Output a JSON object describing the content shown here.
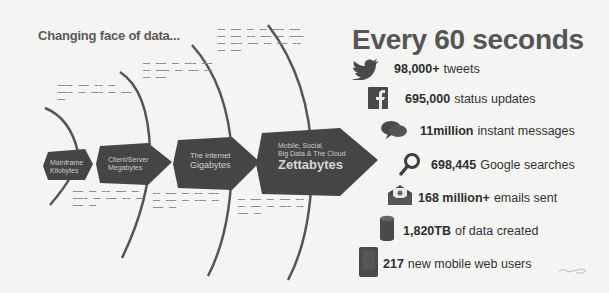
{
  "left_panel": {
    "title": "Changing face of data...",
    "stages": [
      {
        "line1": "Mainframe",
        "line2": "Kilobytes",
        "big": ""
      },
      {
        "line1": "Client/Server",
        "line2": "Megabytes",
        "big": ""
      },
      {
        "line1": "The Internet",
        "line2": "Gigabytes",
        "big": ""
      },
      {
        "line1": "Mobile, Social,",
        "line2": "Big Data & The Cloud",
        "big": "Zettabytes"
      }
    ]
  },
  "right_panel": {
    "title": "Every 60 seconds",
    "stats": [
      {
        "icon": "twitter-bird-icon",
        "value": "98,000+",
        "label": "tweets"
      },
      {
        "icon": "facebook-icon",
        "value": "695,000",
        "label": "status updates"
      },
      {
        "icon": "chat-bubbles-icon",
        "value": "11million",
        "label": "instant messages"
      },
      {
        "icon": "magnifier-icon",
        "value": "698,445",
        "label": "Google searches"
      },
      {
        "icon": "envelope-icon",
        "value": "168 million+",
        "label": "emails sent"
      },
      {
        "icon": "database-icon",
        "value": "1,820TB",
        "label": "of data created"
      },
      {
        "icon": "mobile-phone-icon",
        "value": "217",
        "label": "new mobile web users"
      }
    ]
  },
  "colors": {
    "background": "#f4f4f2",
    "arrow_fill": "#454545",
    "title_text": "#555555",
    "stat_text": "#333333",
    "icon_fill": "#4a4a4a"
  }
}
